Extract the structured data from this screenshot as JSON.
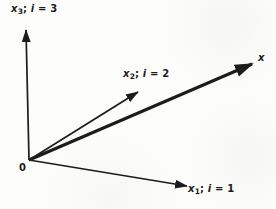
{
  "figure": {
    "ink_color": "#1c1c1c",
    "background_color": "#fcfcfa"
  },
  "labels": {
    "x3_axis": {
      "var": "x",
      "sub": "3",
      "sep": "; ",
      "index_var": "i",
      "eq": " = ",
      "value": "3"
    },
    "x2_axis": {
      "var": "x",
      "sub": "2",
      "sep": "; ",
      "index_var": "i",
      "eq": " = ",
      "value": "2"
    },
    "x1_axis": {
      "var": "x",
      "sub": "1",
      "sep": "; ",
      "index_var": "i",
      "eq": " = ",
      "value": "1"
    },
    "vector": {
      "label": "x"
    },
    "origin": {
      "label": "0"
    }
  }
}
